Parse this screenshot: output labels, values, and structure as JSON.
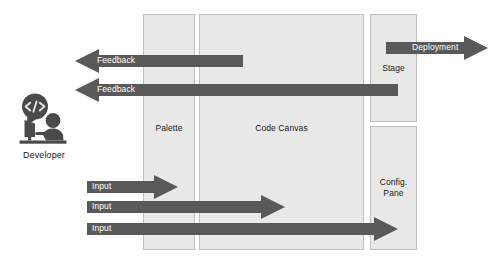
{
  "diagram": {
    "canvas": {
      "width": 501,
      "height": 268
    },
    "colors": {
      "arrow": "#595959",
      "panel_fill": "#e8e8e8",
      "panel_stroke": "#bfbfbf",
      "arrow_text": "#ffffff",
      "label_text": "#1a1a1a",
      "icon": "#4a4a4a",
      "background": "#ffffff"
    }
  },
  "actor": {
    "label": "Developer",
    "icon": "developer-at-desk-icon",
    "bubble_glyph": "</>"
  },
  "panels": [
    {
      "id": "palette",
      "label": "Palette",
      "x": 143,
      "y": 14,
      "width": 52,
      "height": 236
    },
    {
      "id": "code-canvas",
      "label": "Code Canvas",
      "x": 199,
      "y": 14,
      "width": 165,
      "height": 236
    },
    {
      "id": "stage",
      "label": "Stage",
      "x": 370,
      "y": 14,
      "width": 47,
      "height": 108
    },
    {
      "id": "config-pane",
      "label": "Config.\nPane",
      "label_line1": "Config.",
      "label_line2": "Pane",
      "x": 370,
      "y": 126,
      "width": 47,
      "height": 124
    }
  ],
  "arrows": [
    {
      "id": "feedback-from-code-canvas",
      "label": "Feedback",
      "direction": "left",
      "from": "Code Canvas",
      "to": "Developer",
      "tail_x": 243,
      "tip_x": 75,
      "y": 55,
      "thickness": 12
    },
    {
      "id": "feedback-from-stage",
      "label": "Feedback",
      "direction": "left",
      "from": "Stage",
      "to": "Developer",
      "tail_x": 398,
      "tip_x": 75,
      "y": 84,
      "thickness": 12
    },
    {
      "id": "deployment",
      "label": "Deployment",
      "direction": "right",
      "from": "Stage",
      "to": "External",
      "tail_x": 386,
      "tip_x": 488,
      "y": 42,
      "thickness": 12
    },
    {
      "id": "input-to-palette",
      "label": "Input",
      "direction": "right",
      "from": "Developer",
      "to": "Palette",
      "tail_x": 87,
      "tip_x": 178,
      "y": 181,
      "thickness": 12
    },
    {
      "id": "input-to-code-canvas",
      "label": "Input",
      "direction": "right",
      "from": "Developer",
      "to": "Code Canvas",
      "tail_x": 87,
      "tip_x": 285,
      "y": 201,
      "thickness": 12
    },
    {
      "id": "input-to-config-pane",
      "label": "Input",
      "direction": "right",
      "from": "Developer",
      "to": "Config. Pane",
      "tail_x": 87,
      "tip_x": 398,
      "y": 223,
      "thickness": 12
    }
  ]
}
